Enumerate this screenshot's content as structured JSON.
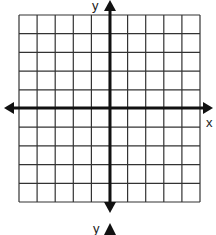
{
  "diagram": {
    "type": "coordinate-grid",
    "grid": {
      "columns": 10,
      "rows": 10,
      "left": 19,
      "top": 15,
      "right": 200,
      "bottom": 202,
      "line_color": "#333333"
    },
    "axes": {
      "x_axis_y": 108,
      "y_axis_x": 110,
      "color": "#111111",
      "x_label": "x",
      "y_label_top": "y",
      "y_label_bottom": "y"
    }
  }
}
